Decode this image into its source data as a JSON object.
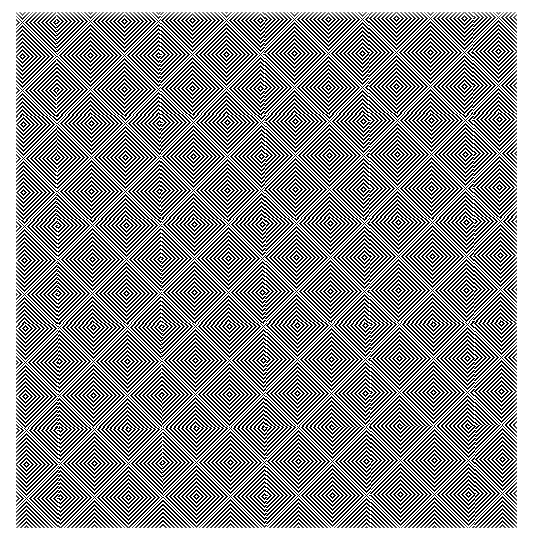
{
  "artwork": {
    "title": "Nested Chevron Moire Field",
    "medium": "black line on white ground",
    "orientation": "square panel on white margin",
    "alt_text": "A square op-art plate densely filled with nested chevrons and concentric diamonds forming a shimmering moire lattice."
  },
  "canvas": {
    "width": 533,
    "height": 540,
    "background_color": "#ffffff"
  },
  "panel": {
    "left": 16,
    "top": 12,
    "width": 501,
    "height": 516,
    "rotation_degrees": -0.55,
    "background_color": "#ffffff"
  },
  "palette": {
    "ink": "#000000",
    "ground": "#ffffff",
    "margin": "#ffffff"
  },
  "pattern": {
    "motif": "nested-chevron-diamond",
    "stripe_period_px": 4,
    "stripe_width_px": 2,
    "line_angle_degrees": 45,
    "cell_period_x_px": 68,
    "cell_period_y_px": 68,
    "columns": 9,
    "rows": 9,
    "rings_per_motif": 9,
    "symmetry": "alternating diagonal quadrants with saddle points between motif centers"
  },
  "chart_data": {
    "type": "heatmap",
    "xlabel": "",
    "ylabel": "",
    "x": [
      0,
      68,
      136,
      204,
      272,
      340,
      408,
      476,
      544
    ],
    "y": [
      0,
      68,
      136,
      204,
      272,
      340,
      408,
      476,
      544
    ],
    "series": [
      {
        "name": "motif-phase-row-0",
        "values": [
          0,
          1,
          0,
          1,
          0,
          1,
          0,
          1,
          0
        ]
      },
      {
        "name": "motif-phase-row-1",
        "values": [
          1,
          0,
          1,
          0,
          1,
          0,
          1,
          0,
          1
        ]
      },
      {
        "name": "motif-phase-row-2",
        "values": [
          0,
          1,
          0,
          1,
          0,
          1,
          0,
          1,
          0
        ]
      },
      {
        "name": "motif-phase-row-3",
        "values": [
          1,
          0,
          1,
          0,
          1,
          0,
          1,
          0,
          1
        ]
      },
      {
        "name": "motif-phase-row-4",
        "values": [
          0,
          1,
          0,
          1,
          0,
          1,
          0,
          1,
          0
        ]
      },
      {
        "name": "motif-phase-row-5",
        "values": [
          1,
          0,
          1,
          0,
          1,
          0,
          1,
          0,
          1
        ]
      },
      {
        "name": "motif-phase-row-6",
        "values": [
          0,
          1,
          0,
          1,
          0,
          1,
          0,
          1,
          0
        ]
      },
      {
        "name": "motif-phase-row-7",
        "values": [
          1,
          0,
          1,
          0,
          1,
          0,
          1,
          0,
          1
        ]
      },
      {
        "name": "motif-phase-row-8",
        "values": [
          0,
          1,
          0,
          1,
          0,
          1,
          0,
          1,
          0
        ]
      }
    ],
    "legend": [],
    "annotations": [],
    "grid": false,
    "xlim": [
      0,
      544
    ],
    "ylim": [
      0,
      544
    ],
    "colormap": [
      "#ffffff",
      "#000000"
    ]
  }
}
